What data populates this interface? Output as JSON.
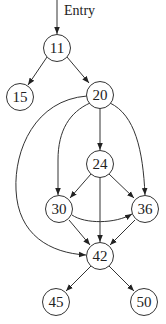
{
  "diagram": {
    "type": "control-flow-graph",
    "entry_label": "Entry",
    "nodes": [
      {
        "id": "11",
        "label": "11"
      },
      {
        "id": "15",
        "label": "15"
      },
      {
        "id": "20",
        "label": "20"
      },
      {
        "id": "24",
        "label": "24"
      },
      {
        "id": "30",
        "label": "30"
      },
      {
        "id": "36",
        "label": "36"
      },
      {
        "id": "42",
        "label": "42"
      },
      {
        "id": "45",
        "label": "45"
      },
      {
        "id": "50",
        "label": "50"
      }
    ],
    "edges": [
      {
        "from": "entry",
        "to": "11"
      },
      {
        "from": "11",
        "to": "15"
      },
      {
        "from": "11",
        "to": "20"
      },
      {
        "from": "20",
        "to": "24"
      },
      {
        "from": "20",
        "to": "30"
      },
      {
        "from": "20",
        "to": "36"
      },
      {
        "from": "20",
        "to": "42"
      },
      {
        "from": "24",
        "to": "30"
      },
      {
        "from": "24",
        "to": "36"
      },
      {
        "from": "24",
        "to": "42"
      },
      {
        "from": "30",
        "to": "36"
      },
      {
        "from": "30",
        "to": "42"
      },
      {
        "from": "36",
        "to": "42"
      },
      {
        "from": "42",
        "to": "45"
      },
      {
        "from": "42",
        "to": "50"
      }
    ],
    "colors": {
      "stroke": "#333333",
      "text": "#222222",
      "background": "#ffffff"
    }
  }
}
